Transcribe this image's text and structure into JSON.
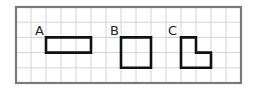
{
  "diagram": {
    "type": "grid-shapes",
    "grid": {
      "origin_x": 16,
      "origin_y": 7,
      "cols": 15,
      "rows": 5,
      "cell_w": 15,
      "cell_h": 15.2,
      "grid_color": "#d4d4d4",
      "border_color": "#7a7a7a"
    },
    "shapes": [
      {
        "id": "A",
        "label": "A",
        "kind": "rectangle",
        "cells": "3x1",
        "points": [
          [
            2,
            2
          ],
          [
            5,
            2
          ],
          [
            5,
            3
          ],
          [
            2,
            3
          ]
        ],
        "label_pos": [
          35,
          35
        ]
      },
      {
        "id": "B",
        "label": "B",
        "kind": "square",
        "cells": "2x2",
        "points": [
          [
            7,
            2
          ],
          [
            9,
            2
          ],
          [
            9,
            4
          ],
          [
            7,
            4
          ]
        ],
        "label_pos": [
          110,
          35
        ]
      },
      {
        "id": "C",
        "label": "C",
        "kind": "L-shape",
        "cells": "3 unit squares",
        "points": [
          [
            11,
            2
          ],
          [
            12,
            2
          ],
          [
            12,
            3
          ],
          [
            13,
            3
          ],
          [
            13,
            4
          ],
          [
            11,
            4
          ]
        ],
        "label_pos": [
          168,
          35
        ]
      }
    ],
    "stroke_color": "#111111"
  }
}
